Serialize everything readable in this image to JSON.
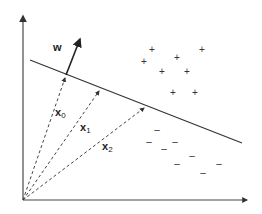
{
  "diagram": {
    "type": "linear-classifier-geometry",
    "labels": {
      "weight_vector": "w",
      "vectors": [
        {
          "name": "x",
          "sub": "0"
        },
        {
          "name": "x",
          "sub": "1"
        },
        {
          "name": "x",
          "sub": "2"
        }
      ]
    },
    "positive_class_symbol": "+",
    "negative_class_symbol": "–",
    "positive_count": 8,
    "negative_count": 8,
    "colors": {
      "axes": "#777777",
      "boundary": "#333333",
      "vectors": "#444444",
      "weight": "#222222"
    }
  }
}
